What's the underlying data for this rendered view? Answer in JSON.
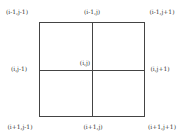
{
  "diagram": {
    "type": "finite-difference stencil grid",
    "center_label": "(i,j)",
    "labels": {
      "top_left": "(i-1,j-1)",
      "top_center": "(i-1,j)",
      "top_right": "(i-1,j+1)",
      "middle_left": "(i,j-1)",
      "middle_right": "(i,j+1)",
      "bottom_left": "(i+1,j-1)",
      "bottom_center": "(i+1,j)",
      "bottom_right": "(i+1,j+1)"
    }
  }
}
